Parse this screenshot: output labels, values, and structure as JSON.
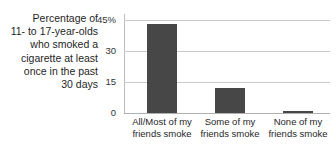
{
  "caption": {
    "lines": [
      "Percentage of",
      "11- to 17-year-olds",
      "who smoked a",
      "cigarette at least",
      "once in the past",
      "30 days"
    ]
  },
  "colors": {
    "bar": "#474747",
    "gridline": "#c9c9c9",
    "axis": "#bdbdbd",
    "text": "#1f1f1f",
    "background": "#ffffff"
  },
  "axis": {
    "yticks": [
      {
        "label": "45%",
        "value": 45
      },
      {
        "label": "30",
        "value": 30
      },
      {
        "label": "15",
        "value": 15
      },
      {
        "label": "0",
        "value": 0
      }
    ]
  },
  "bars": [
    {
      "line1": "All/Most of my",
      "line2": "friends smoke",
      "value": 43
    },
    {
      "line1": "Some of my",
      "line2": "friends smoke",
      "value": 12
    },
    {
      "line1": "None of my",
      "line2": "friends smoke",
      "value": 1
    }
  ],
  "chart_data": {
    "type": "bar",
    "title": "Percentage of 11- to 17-year-olds who smoked a cigarette at least once in the past 30 days",
    "categories": [
      "All/Most of my friends smoke",
      "Some of my friends smoke",
      "None of my friends smoke"
    ],
    "values": [
      43,
      12,
      1
    ],
    "xlabel": "",
    "ylabel": "Percentage of 11- to 17-year-olds who smoked a cigarette at least once in the past 30 days",
    "ylim": [
      0,
      45
    ],
    "ytick_labels": [
      "0",
      "15",
      "30",
      "45%"
    ],
    "ytick_values": [
      0,
      15,
      30,
      45
    ],
    "grid": true,
    "legend": false,
    "units": "percent",
    "bar_color": "#474747"
  }
}
